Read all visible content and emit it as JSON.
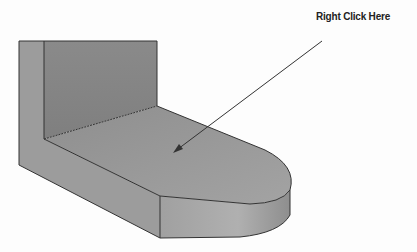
{
  "annotation": {
    "label": "Right Click Here",
    "arrow_from": [
      322,
      41
    ],
    "arrow_to": [
      173,
      153
    ]
  },
  "model": {
    "description": "L-shaped bracket with rounded end flange",
    "target_face": "top face of horizontal flange"
  },
  "colors": {
    "background": "#fdfdfd",
    "wall_front": "#8c8c8c",
    "wall_side": "#9d9d9d",
    "flange_top": "#9a9a9a",
    "flange_side": "#a8a8a8",
    "edge": "#333333",
    "arrow": "#333333",
    "label": "#222222"
  }
}
